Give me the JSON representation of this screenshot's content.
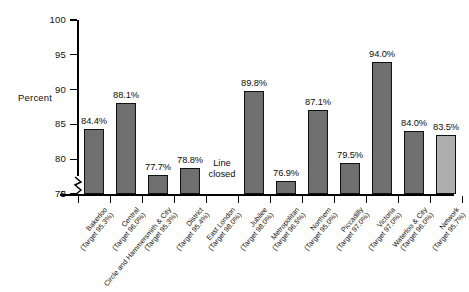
{
  "chart_data": {
    "type": "bar",
    "title": "",
    "xlabel": "",
    "ylabel": "Percent",
    "ylim": [
      75,
      100
    ],
    "y_axis_break": true,
    "y_ticks": [
      "0",
      "75",
      "80",
      "85",
      "90",
      "95",
      "100"
    ],
    "grid": false,
    "legend": "none",
    "categories": [
      "Bakerloo",
      "Central",
      "Circle and Hammersmith & City",
      "District",
      "East London",
      "Jubilee",
      "Metropolitan",
      "Northern",
      "Piccadilly",
      "Victoria",
      "Waterloo & City",
      "Network"
    ],
    "category_targets": [
      "(Target 95.3%)",
      "(Target 96.0%)",
      "(Target 95.3%)",
      "(Target 95.4%)",
      "(Target 98.0%)",
      "(Target 98.0%)",
      "(Target 96.5%)",
      "(Target 95.0%)",
      "(Target 97.0%)",
      "(Target 97.0%)",
      "(Target 96.0%)",
      "(Target 95.7%)"
    ],
    "values": [
      84.4,
      88.1,
      77.7,
      78.8,
      null,
      89.8,
      76.9,
      87.1,
      79.5,
      94.0,
      84.0,
      83.5
    ],
    "value_labels": [
      "84.4%",
      "88.1%",
      "77.7%",
      "78.8%",
      "",
      "89.8%",
      "76.9%",
      "87.1%",
      "79.5%",
      "94.0%",
      "84.0%",
      "83.5%"
    ],
    "annotations": [
      {
        "category": "East London",
        "text_line1": "Line",
        "text_line2": "closed"
      }
    ],
    "colors": {
      "bar": "#6f6f6f",
      "bar_highlight": "#aeaeae",
      "bar_outline": "#111111",
      "axis": "#000000",
      "text": "#101010"
    },
    "highlight_category": "Network"
  }
}
